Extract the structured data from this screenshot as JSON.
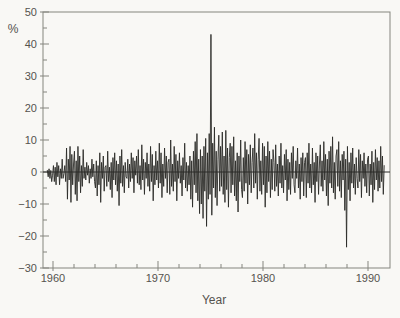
{
  "figure": {
    "unit_label": "%",
    "x_axis_label": "Year"
  },
  "axes": {
    "y_tick_labels": [
      "50",
      "40",
      "30",
      "20",
      "10",
      "0",
      "−10",
      "−20",
      "−30"
    ],
    "y_tick_values": [
      50,
      40,
      30,
      20,
      10,
      0,
      -10,
      -20,
      -30
    ],
    "y_minor_step": 5,
    "x_tick_labels": [
      "1960",
      "1970",
      "1980",
      "1990"
    ],
    "x_tick_values": [
      1960,
      1970,
      1980,
      1990
    ],
    "x_minor_step": 2
  },
  "colors": {
    "paper": "#f9f8f5",
    "frame": "#85857f",
    "line": "#2b2b28",
    "text": "#55534e"
  },
  "chart_data": {
    "type": "line",
    "title": "",
    "xlabel": "Year",
    "ylabel": "%",
    "xlim": [
      1959,
      1992.1
    ],
    "ylim": [
      -30,
      50
    ],
    "grid": false,
    "legend": "none",
    "zero_line": true,
    "key_points": [
      {
        "label": "positive-spike",
        "year": 1975.0,
        "value": 43
      },
      {
        "label": "negative-spike",
        "year": 1987.9,
        "value": -23.5
      }
    ],
    "series": [
      {
        "name": "monthly-percent-change",
        "start_year": 1959.4583,
        "step_years": 0.0833333,
        "values": [
          0.5,
          -1.5,
          1,
          -2,
          0.5,
          -3,
          -1,
          2,
          -3,
          1.5,
          -4,
          3,
          -1.5,
          2,
          -4,
          1,
          -2,
          4,
          -2,
          -0.5,
          2,
          -3,
          7.5,
          -8.5,
          4,
          -2.5,
          8,
          -9.5,
          5.5,
          -4,
          2.5,
          6.5,
          -7,
          3.5,
          -9,
          8,
          -3,
          5,
          -6.5,
          2,
          -4.5,
          7,
          -2,
          1.5,
          -2.5,
          3,
          -1,
          2,
          -3.5,
          1,
          -2,
          4,
          -1.5,
          2.5,
          -3,
          -5,
          3.5,
          -7.5,
          2,
          -4,
          6,
          -9.5,
          3,
          -2,
          5,
          -6,
          1.5,
          2,
          -4.5,
          6.5,
          -3,
          1.5,
          -5.5,
          3,
          -8,
          4.5,
          -2.5,
          6,
          -4,
          3.5,
          -6,
          2.5,
          -10.5,
          5,
          -3.5,
          7,
          -4.5,
          2,
          -6.5,
          3,
          -1.5,
          -2,
          4,
          -5,
          2.5,
          -3,
          6,
          -2,
          4.5,
          -6.5,
          3.5,
          -1,
          5,
          -3.5,
          7,
          -4,
          2,
          -5.5,
          8.5,
          -2.5,
          4,
          -7,
          3,
          -2,
          6,
          -4.5,
          2.5,
          -6,
          8,
          -3,
          5.5,
          -9,
          2,
          -4,
          6.5,
          -2.5,
          3.5,
          -5,
          9,
          -3.5,
          6,
          -8,
          2.5,
          -4.5,
          7.5,
          -2,
          5,
          -6.5,
          3,
          4,
          -7,
          10,
          -4.5,
          2.5,
          -6,
          8,
          -3,
          5.5,
          -9,
          3.5,
          -2,
          6,
          -3.5,
          2,
          -7.5,
          4.5,
          -2.5,
          9,
          -5,
          3,
          -6,
          2,
          -4,
          5,
          -8.5,
          3.5,
          -11,
          6.5,
          -4,
          9.5,
          -6.5,
          12,
          -9,
          4,
          -13,
          7,
          -10,
          5,
          -14.5,
          8,
          -6,
          10.5,
          -17,
          6,
          -8.5,
          12,
          -7,
          43,
          -13.5,
          9,
          -5,
          14,
          -8,
          6.5,
          -10.5,
          4,
          11.5,
          -6,
          8,
          -4.5,
          12.5,
          -7,
          5,
          -9.5,
          13,
          -5.5,
          7.5,
          -11,
          4.5,
          9,
          -6.5,
          8,
          -4,
          11,
          -7.5,
          3.5,
          -9,
          6,
          -12.5,
          5,
          -3,
          10,
          -5.5,
          -8,
          4.5,
          -6,
          9.5,
          -3.5,
          7,
          -10,
          5.5,
          -4,
          8.5,
          -6.5,
          3,
          7.5,
          -5,
          12,
          -3.5,
          6,
          -8.5,
          4,
          10.5,
          -6,
          3.5,
          -7,
          9,
          -4,
          8,
          -11,
          5,
          -6.5,
          9.5,
          -3,
          6.5,
          -8,
          4,
          -5.5,
          7,
          3,
          -6,
          8.5,
          -4.5,
          2.5,
          -7.5,
          5,
          -3.5,
          9,
          -5,
          2,
          -6.5,
          5.5,
          -2.5,
          7,
          -9,
          4,
          -5.5,
          3,
          -7,
          6,
          -2,
          8,
          -4,
          -6.5,
          3.5,
          -2,
          7.5,
          -5,
          2.5,
          -8.5,
          4.5,
          -3,
          6,
          -7.5,
          3,
          4.5,
          -8,
          6,
          -3.5,
          9,
          -5,
          2.5,
          -6.5,
          7.5,
          -4,
          3,
          -9.5,
          6,
          -3,
          5,
          -7,
          2.5,
          8.5,
          -4.5,
          3.5,
          -6,
          9.5,
          -2.5,
          5.5,
          -7.5,
          4,
          -10.5,
          6.5,
          -3.5,
          8,
          -5,
          11,
          -6.5,
          3,
          -8.5,
          5,
          7,
          -4.5,
          9.5,
          -6,
          3.5,
          -8,
          5.5,
          -2.5,
          6.5,
          -12,
          4,
          -23.5,
          8,
          -5.5,
          3,
          -9,
          6,
          -3.5,
          7.5,
          -5,
          2.5,
          -7,
          4.5,
          -2,
          -5,
          7,
          -3,
          5.5,
          -8,
          3.5,
          -2,
          6,
          -4.5,
          2.5,
          -6.5,
          4,
          5,
          -7.5,
          2.5,
          -4,
          6.5,
          -9.5,
          3,
          -5.5,
          7,
          -2.5,
          4.5,
          -6,
          3.5,
          -5,
          8,
          -3,
          5,
          -7,
          2
        ]
      }
    ]
  }
}
